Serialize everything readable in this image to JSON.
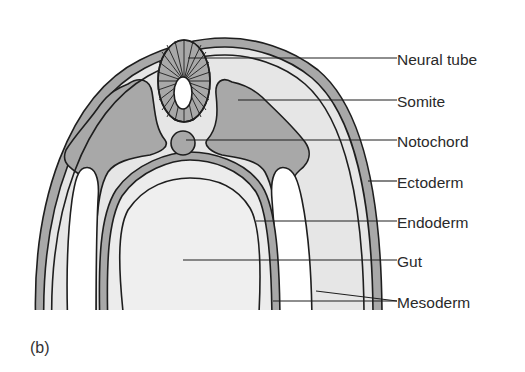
{
  "figure": {
    "panel_label": "(b)",
    "labels": [
      {
        "id": "neural-tube",
        "text": "Neural tube"
      },
      {
        "id": "somite",
        "text": "Somite"
      },
      {
        "id": "notochord",
        "text": "Notochord"
      },
      {
        "id": "ectoderm",
        "text": "Ectoderm"
      },
      {
        "id": "endoderm",
        "text": "Endoderm"
      },
      {
        "id": "gut",
        "text": "Gut"
      },
      {
        "id": "mesoderm",
        "text": "Mesoderm"
      }
    ],
    "colors": {
      "background": "#ffffff",
      "outline": "#1e1e1e",
      "dark_tissue": "#a8a8a8",
      "light_tissue": "#e6e6e6",
      "gut_lumen": "#efefef",
      "cavity": "#ffffff"
    }
  }
}
